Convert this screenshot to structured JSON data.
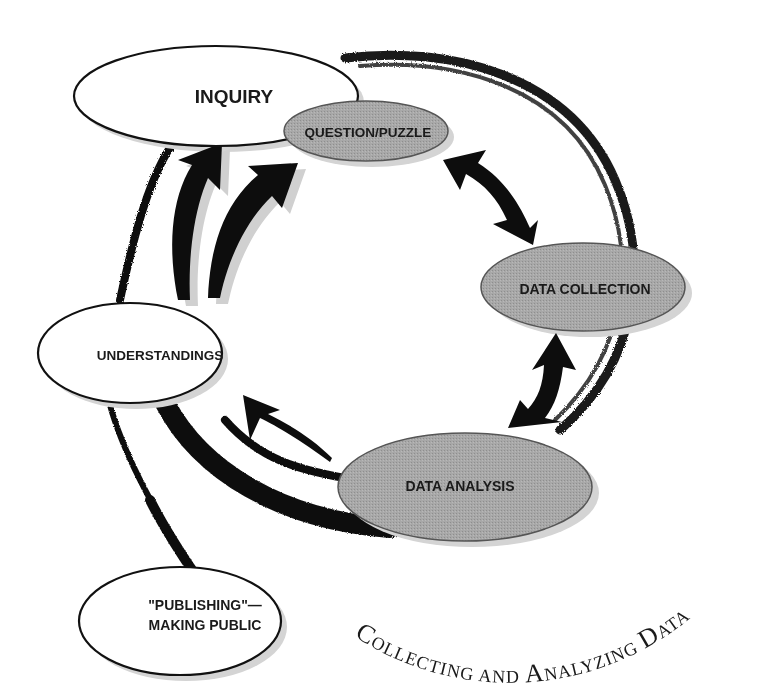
{
  "diagram": {
    "type": "cycle-diagram",
    "colors": {
      "white_node_fill": "#ffffff",
      "grey_node_fill": "#a3a3a3",
      "node_stroke": "#111111",
      "arrow": "#0d0d0d",
      "shadow": "#cfcfcf",
      "ring": "#111111"
    },
    "nodes": {
      "inquiry": {
        "label": "INQUIRY",
        "style": "white"
      },
      "question_puzzle": {
        "label": "QUESTION/PUZZLE",
        "style": "grey"
      },
      "data_collection": {
        "label": "DATA COLLECTION",
        "style": "grey"
      },
      "data_analysis": {
        "label": "DATA ANALYSIS",
        "style": "grey"
      },
      "understandings": {
        "label": "UNDERSTANDINGS",
        "style": "white"
      },
      "publishing": {
        "label_line1": "\"PUBLISHING\"—",
        "label_line2": "MAKING PUBLIC",
        "style": "white"
      }
    },
    "arrows": [
      {
        "from": "question_puzzle",
        "to": "data_collection",
        "direction": "bidirectional"
      },
      {
        "from": "data_collection",
        "to": "data_analysis",
        "direction": "bidirectional"
      },
      {
        "from": "data_analysis",
        "to": "understandings",
        "direction": "one-way"
      },
      {
        "from": "understandings",
        "to": "inquiry",
        "direction": "one-way"
      },
      {
        "from": "understandings",
        "to": "question_puzzle",
        "direction": "one-way"
      }
    ],
    "ring_label": {
      "first_C": "C",
      "part1": "OLLECTING AND ",
      "first_A": "A",
      "part2": "NALYZING ",
      "first_D": "D",
      "part3": "ATA"
    }
  }
}
